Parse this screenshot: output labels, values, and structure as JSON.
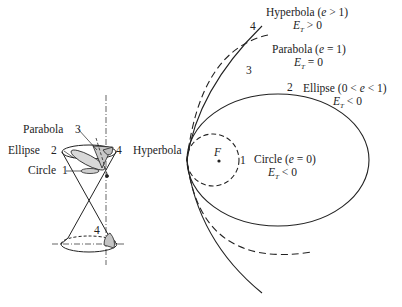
{
  "cone": {
    "labels": {
      "parabola": "Parabola",
      "parabola_num": "3",
      "ellipse": "Ellipse",
      "ellipse_num": "2",
      "circle": "Circle",
      "circle_num": "1",
      "hyperbola": "Hyperbola",
      "hyperbola_num": "4",
      "hyperbola_lower_num": "4"
    }
  },
  "orbits": {
    "focus_label": "F",
    "hyperbola": {
      "num": "4",
      "title": "Hyperbola (",
      "var": "e",
      "cond": " > 1)",
      "energy_E": "E",
      "energy_sub": "T",
      "energy_rel": " > 0"
    },
    "parabola": {
      "num": "3",
      "title": "Parabola (",
      "var": "e",
      "cond": " = 1)",
      "energy_E": "E",
      "energy_sub": "T",
      "energy_rel": " = 0"
    },
    "ellipse": {
      "num": "2",
      "title": "Ellipse (0 < ",
      "var": "e",
      "cond": " < 1)",
      "energy_E": "E",
      "energy_sub": "T",
      "energy_rel": " < 0"
    },
    "circle": {
      "num": "1",
      "title": "Circle (",
      "var": "e",
      "cond": " = 0)",
      "energy_E": "E",
      "energy_sub": "T",
      "energy_rel": " < 0"
    }
  },
  "colors": {
    "stroke": "#222222",
    "fill_shade": "#cfcfcf"
  }
}
